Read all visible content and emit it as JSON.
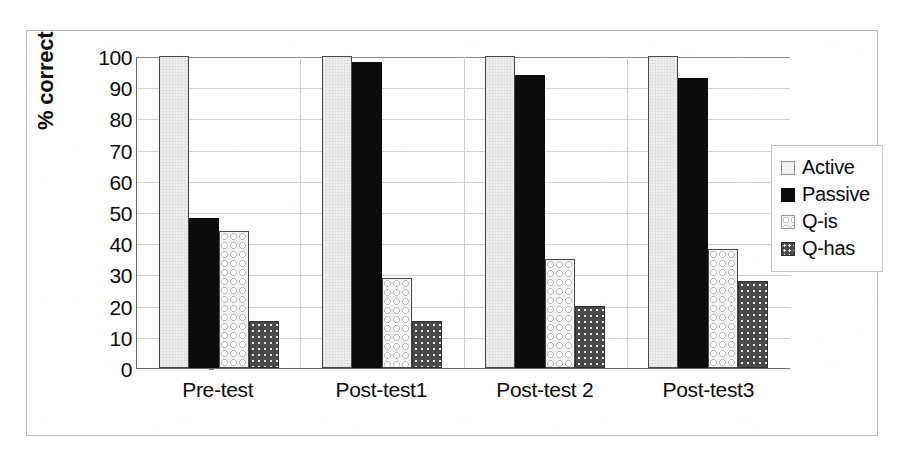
{
  "chart_data": {
    "type": "bar",
    "title": "",
    "xlabel": "",
    "ylabel": "% correct",
    "ylim": [
      0,
      100
    ],
    "yticks": [
      0,
      10,
      20,
      30,
      40,
      50,
      60,
      70,
      80,
      90,
      100
    ],
    "ytick_labels": [
      "0",
      "10",
      "20",
      "30",
      "40",
      "50",
      "60",
      "70",
      "80",
      "90",
      "100"
    ],
    "grid": "horizontal",
    "legend_position": "right",
    "categories": [
      "Pre-test",
      "Post-test1",
      "Post-test 2",
      "Post-test3"
    ],
    "series": [
      {
        "name": "Active",
        "key": "s-active",
        "color": "#eeeeee",
        "values": [
          100,
          100,
          100,
          100
        ]
      },
      {
        "name": "Passive",
        "key": "s-passive",
        "color": "#0b0b0b",
        "values": [
          48,
          98,
          94,
          93
        ]
      },
      {
        "name": "Q-is",
        "key": "s-qis",
        "color": "#f0f0f0",
        "values": [
          44,
          29,
          35,
          38
        ]
      },
      {
        "name": "Q-has",
        "key": "s-qhas",
        "color": "#4f4f4f",
        "values": [
          15,
          15,
          20,
          28
        ]
      }
    ]
  },
  "legend": {
    "entries": [
      {
        "label": "Active",
        "key": "s-active"
      },
      {
        "label": "Passive",
        "key": "s-passive"
      },
      {
        "label": "Q-is",
        "key": "s-qis"
      },
      {
        "label": "Q-has",
        "key": "s-qhas"
      }
    ]
  }
}
